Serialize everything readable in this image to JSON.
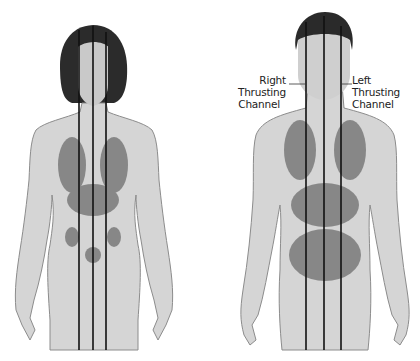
{
  "figure": {
    "figures": [
      {
        "name": "female",
        "channel_count": 3
      },
      {
        "name": "male",
        "channel_count": 3
      }
    ],
    "labels": {
      "right_channel": {
        "line1": "Right Thrusting",
        "line2": "Channel"
      },
      "left_channel": {
        "line1": "Left Thrusting",
        "line2": "Channel"
      }
    },
    "colors": {
      "skin": "#d4d4d4",
      "outline": "#8a8a8a",
      "hair": "#2a2a2a",
      "organs": "#6b6b6b",
      "channel_line": "#111111"
    }
  }
}
